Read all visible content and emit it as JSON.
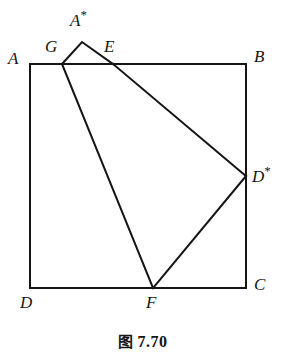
{
  "figure": {
    "caption_cn": "图",
    "caption_number": "7.70",
    "caption_full": "图 7.70",
    "stroke_color": "#151515",
    "background_color": "#ffffff",
    "stroke_width": 2,
    "width": 285,
    "height": 359
  },
  "points": {
    "A": {
      "label": "A",
      "star": "",
      "x": 30,
      "y": 64,
      "label_x": 8,
      "label_y": 50
    },
    "B": {
      "label": "B",
      "star": "",
      "x": 246,
      "y": 64,
      "label_x": 254,
      "label_y": 48
    },
    "C": {
      "label": "C",
      "star": "",
      "x": 246,
      "y": 288,
      "label_x": 254,
      "label_y": 276
    },
    "D": {
      "label": "D",
      "star": "",
      "x": 30,
      "y": 288,
      "label_x": 20,
      "label_y": 294
    },
    "G": {
      "label": "G",
      "star": "",
      "x": 62,
      "y": 64,
      "label_x": 45,
      "label_y": 38
    },
    "E": {
      "label": "E",
      "star": "",
      "x": 113,
      "y": 64,
      "label_x": 104,
      "label_y": 38
    },
    "F": {
      "label": "F",
      "star": "",
      "x": 153,
      "y": 288,
      "label_x": 146,
      "label_y": 294
    },
    "A_star": {
      "label": "A",
      "star": "*",
      "x": 82,
      "y": 42,
      "label_x": 70,
      "label_y": 8
    },
    "D_star": {
      "label": "D",
      "star": "*",
      "x": 246,
      "y": 176,
      "label_x": 252,
      "label_y": 164
    }
  },
  "shapes": {
    "square": {
      "name": "square-ABCD",
      "vertices": [
        "A",
        "B",
        "C",
        "D"
      ],
      "path": "M 30 64 L 246 64 L 246 288 L 30 288 Z"
    },
    "fold_triangle": {
      "name": "triangle-G-Astar-E",
      "vertices": [
        "G",
        "A_star",
        "E"
      ],
      "path": "M 62 64 L 82 42 L 113 64"
    },
    "crease_GF": {
      "name": "crease-G-to-F",
      "path": "M 62 64 L 153 288"
    },
    "crease_ED": {
      "name": "crease-E-to-Dstar",
      "path": "M 113 64 L 246 176"
    },
    "crease_DF": {
      "name": "crease-Dstar-to-F",
      "path": "M 246 176 L 153 288"
    }
  }
}
